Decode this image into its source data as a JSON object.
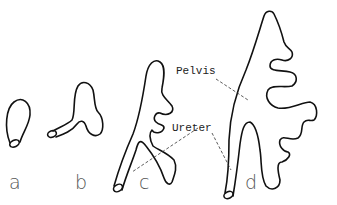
{
  "figure": {
    "stages": [
      {
        "id": "a",
        "label": "a"
      },
      {
        "id": "b",
        "label": "b"
      },
      {
        "id": "c",
        "label": "c"
      },
      {
        "id": "d",
        "label": "d"
      }
    ],
    "annotations": {
      "pelvis": "Pelvis",
      "ureter": "Ureter"
    }
  }
}
